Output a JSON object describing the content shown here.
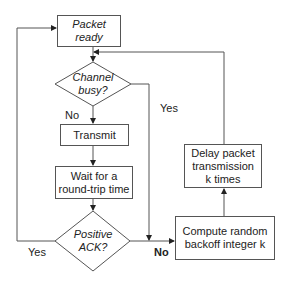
{
  "diagram": {
    "type": "flowchart",
    "nodes": {
      "packet_ready": {
        "line1": "Packet",
        "line2": "ready",
        "shape": "rectangle"
      },
      "channel_busy": {
        "line1": "Channel",
        "line2": "busy?",
        "shape": "diamond"
      },
      "transmit": {
        "label": "Transmit",
        "shape": "rectangle"
      },
      "wait": {
        "line1": "Wait for a",
        "line2": "round-trip time",
        "shape": "rectangle"
      },
      "positive_ack": {
        "line1": "Positive",
        "line2": "ACK?",
        "shape": "diamond"
      },
      "compute_backoff": {
        "line1": "Compute random",
        "line2": "backoff integer k",
        "shape": "rectangle"
      },
      "delay": {
        "line1": "Delay packet",
        "line2": "transmission",
        "line3": "k times",
        "shape": "rectangle"
      }
    },
    "edge_labels": {
      "channel_no": "No",
      "channel_yes": "Yes",
      "ack_yes": "Yes",
      "ack_no": "No"
    },
    "edges": [
      {
        "from": "packet_ready",
        "to": "channel_busy"
      },
      {
        "from": "channel_busy",
        "to": "transmit",
        "label": "No"
      },
      {
        "from": "channel_busy",
        "to": "compute_backoff",
        "label": "Yes"
      },
      {
        "from": "transmit",
        "to": "wait"
      },
      {
        "from": "wait",
        "to": "positive_ack"
      },
      {
        "from": "positive_ack",
        "to": "packet_ready",
        "label": "Yes"
      },
      {
        "from": "positive_ack",
        "to": "compute_backoff",
        "label": "No"
      },
      {
        "from": "compute_backoff",
        "to": "delay"
      },
      {
        "from": "delay",
        "to": "channel_busy"
      }
    ]
  }
}
